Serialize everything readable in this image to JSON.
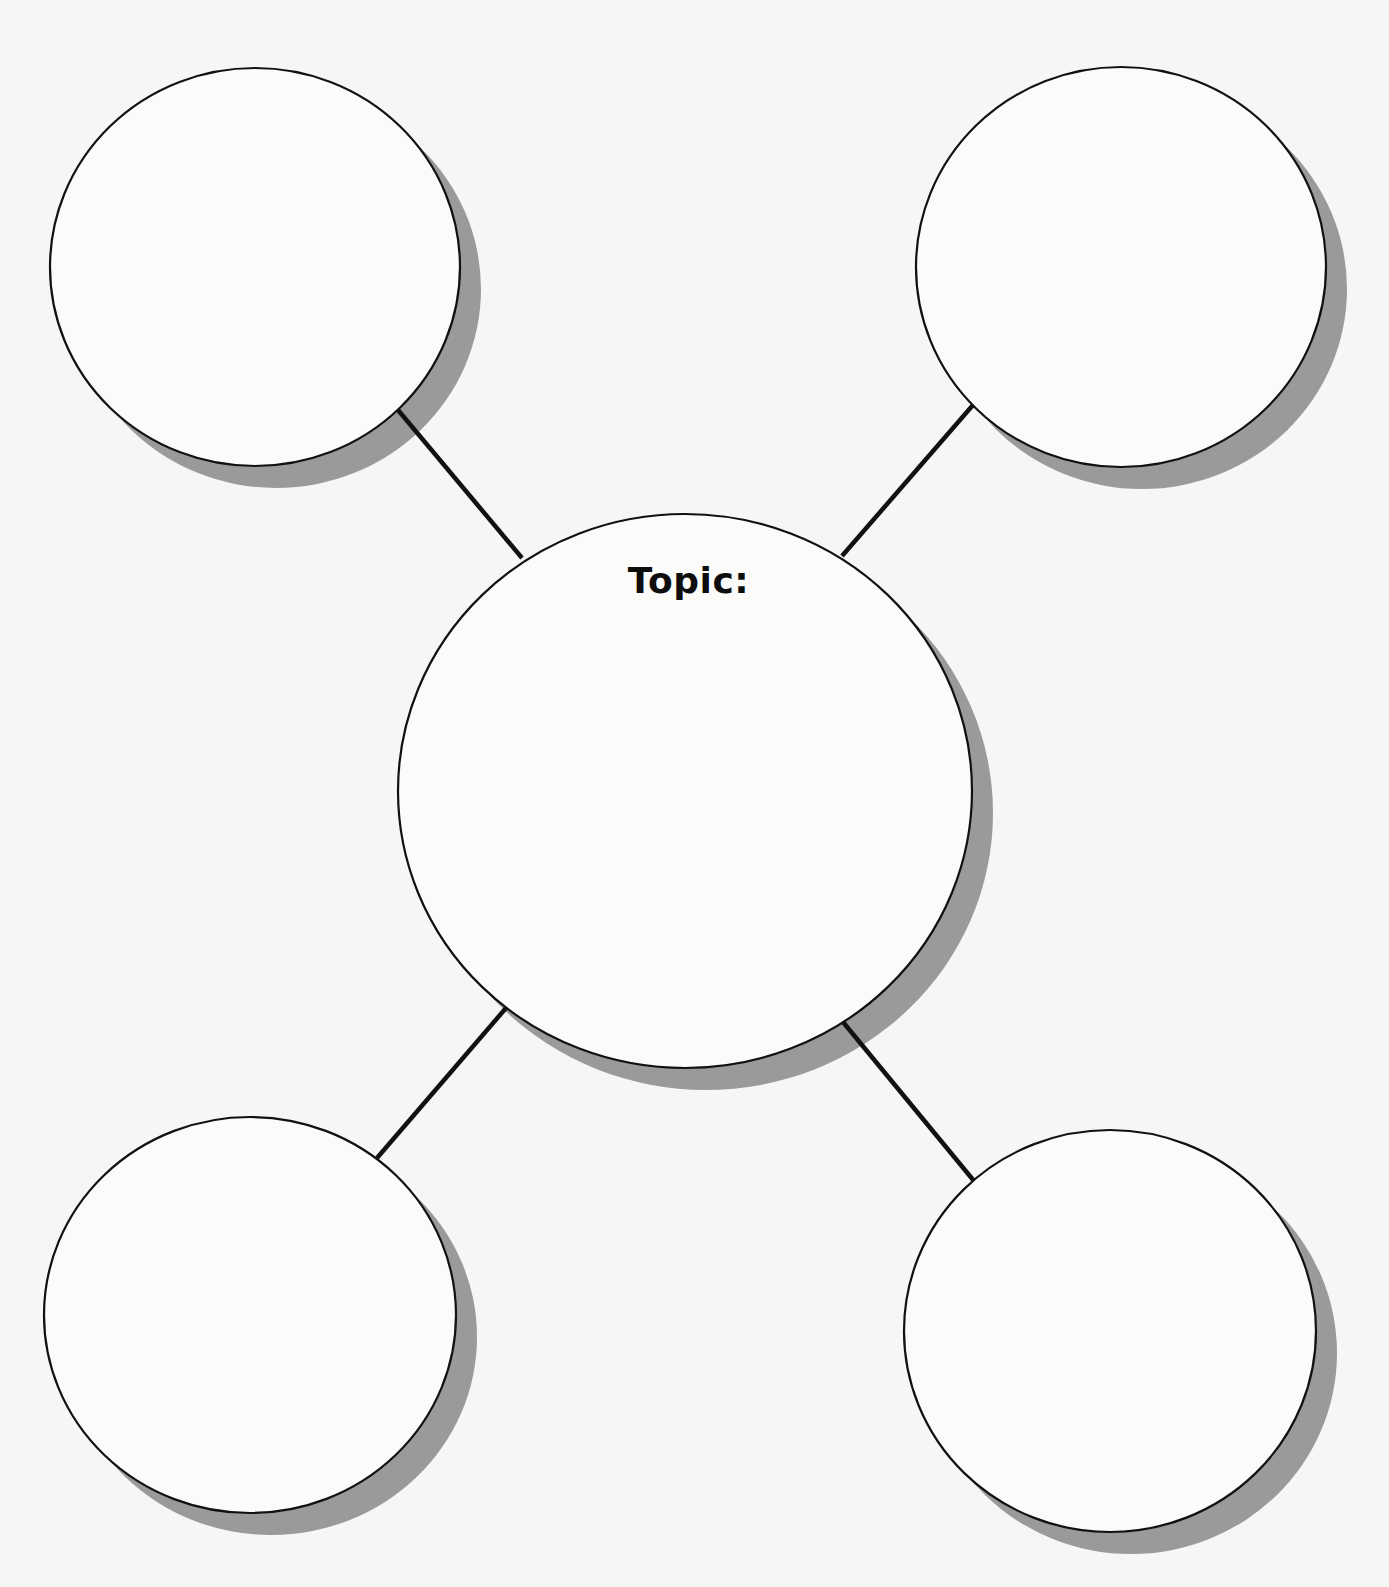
{
  "page": {
    "background": "#f6f6f5",
    "circle_fill": "#fbfbfa",
    "stroke_color": "#111111",
    "shadow_color": "#9a9a9a",
    "shadow_offset": [
      21,
      22
    ]
  },
  "center": {
    "label": "Topic:",
    "cx": 685,
    "cy": 791,
    "rx": 287,
    "ry": 277,
    "label_x": 688,
    "label_y": 563
  },
  "satellites": [
    {
      "id": "top-left",
      "cx": 255,
      "cy": 267,
      "rx": 205,
      "ry": 199
    },
    {
      "id": "top-right",
      "cx": 1121,
      "cy": 267,
      "rx": 205,
      "ry": 200
    },
    {
      "id": "bottom-left",
      "cx": 250,
      "cy": 1315,
      "rx": 206,
      "ry": 198
    },
    {
      "id": "bottom-right",
      "cx": 1110,
      "cy": 1331,
      "rx": 206,
      "ry": 201
    }
  ],
  "connectors": [
    {
      "id": "to-top-left",
      "x1": 398,
      "y1": 410,
      "x2": 522,
      "y2": 558
    },
    {
      "id": "to-top-right",
      "x1": 973,
      "y1": 405,
      "x2": 842,
      "y2": 556
    },
    {
      "id": "to-bottom-left",
      "x1": 506,
      "y1": 1008,
      "x2": 377,
      "y2": 1158
    },
    {
      "id": "to-bottom-right",
      "x1": 843,
      "y1": 1022,
      "x2": 974,
      "y2": 1181
    }
  ]
}
